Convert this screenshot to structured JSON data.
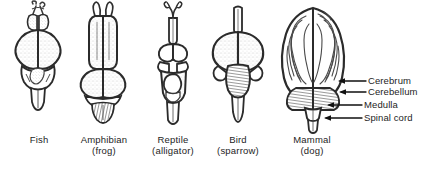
{
  "figure": {
    "ink_color": "#2b2b2b",
    "fill_color": "#ffffff",
    "shade_color": "#8a8a8a",
    "background": "#ffffff"
  },
  "specimens": [
    {
      "id": "fish",
      "name": "Fish",
      "common": ""
    },
    {
      "id": "amphibian",
      "name": "Amphibian",
      "common": "(frog)"
    },
    {
      "id": "reptile",
      "name": "Reptile",
      "common": "(alligator)"
    },
    {
      "id": "bird",
      "name": "Bird",
      "common": "(sparrow)"
    },
    {
      "id": "mammal",
      "name": "Mammal",
      "common": "(dog)"
    }
  ],
  "annotations": [
    {
      "id": "cerebrum",
      "label": "Cerebrum"
    },
    {
      "id": "cerebellum",
      "label": "Cerebellum"
    },
    {
      "id": "medulla",
      "label": "Medulla"
    },
    {
      "id": "spinal-cord",
      "label": "Spinal cord"
    }
  ],
  "caption": {
    "text": ""
  }
}
